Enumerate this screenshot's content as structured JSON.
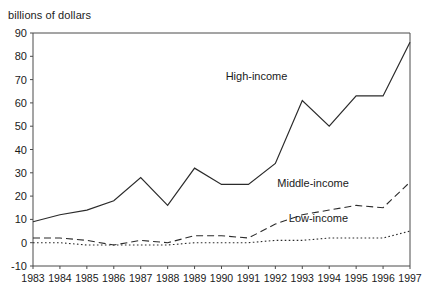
{
  "header": {
    "clipped_title": "",
    "axis_unit_label": "billions of dollars"
  },
  "chart_data": {
    "type": "line",
    "title": "",
    "subtitle": "billions of dollars",
    "xlabel": "",
    "ylabel": "billions of dollars",
    "grid": false,
    "legend_position": "inline-annotations",
    "xlim": [
      1983,
      1997
    ],
    "ylim": [
      -10,
      90
    ],
    "ytick_step": 10,
    "yticks": [
      90,
      80,
      70,
      60,
      50,
      40,
      30,
      20,
      10,
      0,
      -10
    ],
    "ytick_labels": [
      "90",
      "80",
      "70",
      "60",
      "50",
      "40",
      "30",
      "20",
      "10",
      "0",
      "-10"
    ],
    "categories": [
      1983,
      1984,
      1985,
      1986,
      1987,
      1988,
      1989,
      1990,
      1991,
      1992,
      1993,
      1994,
      1995,
      1996,
      1997
    ],
    "xtick_labels": [
      "1983",
      "1984",
      "1985",
      "1986",
      "1987",
      "1988",
      "1989",
      "1990",
      "1991",
      "1992",
      "1993",
      "1994",
      "1995",
      "1996",
      "1997"
    ],
    "series": [
      {
        "name": "High-income",
        "label": "High-income",
        "style": "solid",
        "color": "#2b2b2b",
        "label_x": 1991.3,
        "label_y": 70,
        "values": [
          9,
          12,
          14,
          18,
          28,
          16,
          32,
          25,
          25,
          34,
          61,
          50,
          63,
          63,
          86
        ]
      },
      {
        "name": "Middle-income",
        "label": "Middle-income",
        "style": "dashed",
        "color": "#2b2b2b",
        "label_x": 1993.4,
        "label_y": 24,
        "values": [
          2,
          2,
          1,
          -1,
          1,
          0,
          3,
          3,
          2,
          8,
          12,
          14,
          16,
          15,
          26
        ]
      },
      {
        "name": "Low-income",
        "label": "Low-income",
        "style": "dotted",
        "color": "#2b2b2b",
        "label_x": 1993.6,
        "label_y": 9,
        "values": [
          0,
          0,
          -1,
          -1,
          -1,
          -1,
          0,
          0,
          0,
          1,
          1,
          2,
          2,
          2,
          5
        ]
      }
    ]
  }
}
